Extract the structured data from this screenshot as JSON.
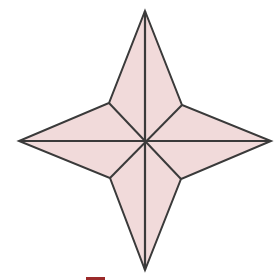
{
  "figure": {
    "type": "four-pointed-star",
    "colors": {
      "fill": "#f1dada",
      "stroke": "#3a3a3a",
      "accent": "#9b2a2a",
      "background": "#ffffff"
    },
    "center": [
      145,
      142
    ],
    "outer_points": {
      "top": [
        145,
        11
      ],
      "right": [
        271,
        141
      ],
      "bottom": [
        145,
        270
      ],
      "left": [
        19,
        141
      ]
    },
    "inner_points": {
      "upper_right": [
        182,
        105
      ],
      "lower_right": [
        181,
        179
      ],
      "lower_left": [
        110,
        178
      ],
      "upper_left": [
        109,
        103
      ]
    }
  }
}
